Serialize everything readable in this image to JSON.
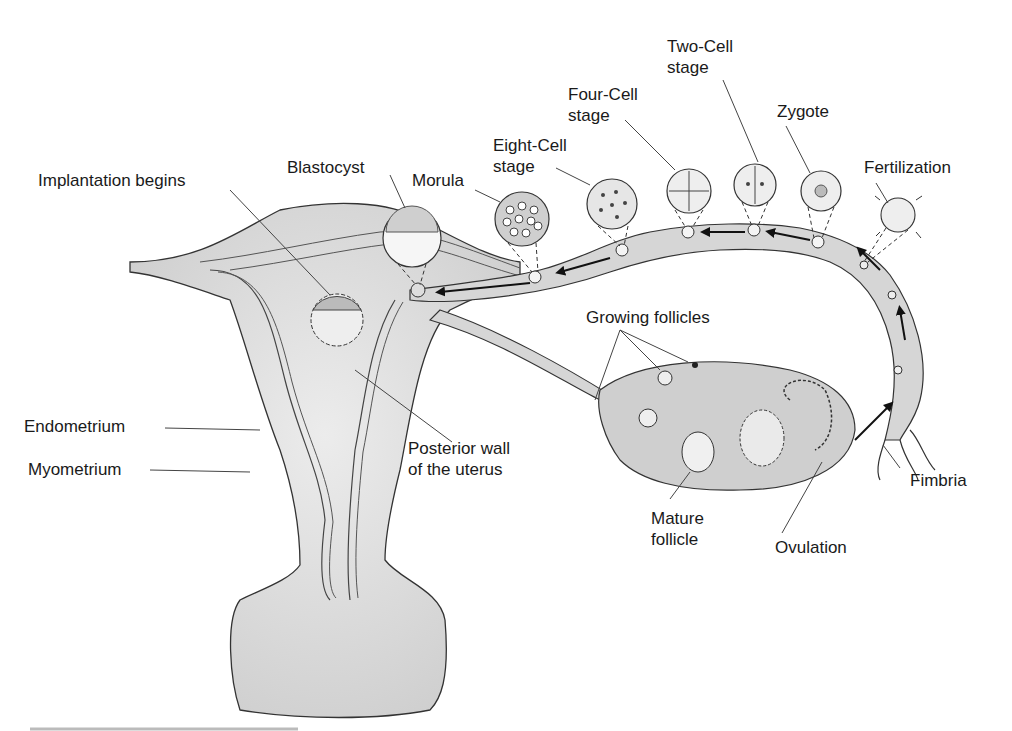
{
  "diagram": {
    "labels": {
      "implantation": "Implantation begins",
      "blastocyst": "Blastocyst",
      "morula": "Morula",
      "eight_cell": "Eight-Cell\nstage",
      "four_cell": "Four-Cell\nstage",
      "two_cell": "Two-Cell\nstage",
      "zygote": "Zygote",
      "fertilization": "Fertilization",
      "growing_follicles": "Growing follicles",
      "endometrium": "Endometrium",
      "myometrium": "Myometrium",
      "posterior_wall": "Posterior wall\nof the uterus",
      "mature_follicle": "Mature\nfollicle",
      "ovulation": "Ovulation",
      "fimbria": "Fimbria"
    },
    "colors": {
      "tissue": "#d9d9d9",
      "tissue_dark": "#c4c4c4",
      "outline": "#333333",
      "text": "#1a1a1a"
    }
  }
}
